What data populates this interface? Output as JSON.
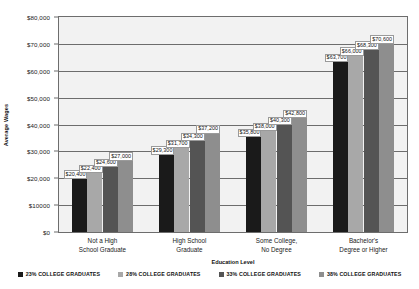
{
  "chart_data": {
    "type": "bar",
    "title": "",
    "xlabel": "Education Level",
    "ylabel": "Average Wages",
    "ylim": [
      0,
      80000
    ],
    "grid": true,
    "legend_position": "bottom",
    "categories": [
      "Not a High\nSchool Graduate",
      "High School\nGraduate",
      "Some College,\nNo Degree",
      "Bachelor's\nDegree or Higher"
    ],
    "category_lines": [
      [
        "Not a High",
        "School Graduate"
      ],
      [
        "High School",
        "Graduate"
      ],
      [
        "Some College,",
        "No Degree"
      ],
      [
        "Bachelor's",
        "Degree or Higher"
      ]
    ],
    "ytick_labels": [
      "$80,000",
      "$70,000",
      "$60,000",
      "$50,000",
      "$40,000",
      "$30,000",
      "$20,000",
      "$10000",
      "$0"
    ],
    "ytick_values": [
      80000,
      70000,
      60000,
      50000,
      40000,
      30000,
      20000,
      10000,
      0
    ],
    "series": [
      {
        "name": "23% COLLEGE GRADUATES",
        "color": "#1a1a1a",
        "values": [
          20400,
          29300,
          35800,
          63700
        ],
        "labels": [
          "$20,400",
          "$29,300",
          "$35,800",
          "$63,700"
        ]
      },
      {
        "name": "28% COLLEGE GRADUATES",
        "color": "#a8a8a8",
        "values": [
          22400,
          31700,
          38000,
          66000
        ],
        "labels": [
          "$22,400",
          "$31,700",
          "$38,000",
          "$66,000"
        ]
      },
      {
        "name": "33% COLLEGE GRADUATES",
        "color": "#545454",
        "values": [
          24600,
          34300,
          40300,
          68300
        ],
        "labels": [
          "$24,600",
          "$34,300",
          "$40,300",
          "$68,300"
        ]
      },
      {
        "name": "38% COLLEGE GRADUATES",
        "color": "#8e8e8e",
        "values": [
          27000,
          37200,
          42800,
          70600
        ],
        "labels": [
          "$27,000",
          "$37,200",
          "$42,800",
          "$70,600"
        ]
      }
    ]
  },
  "style": {
    "plot_background": "#f2f2f2",
    "axis_color": "#6d6d6d",
    "text_color": "#1a1a1a"
  }
}
